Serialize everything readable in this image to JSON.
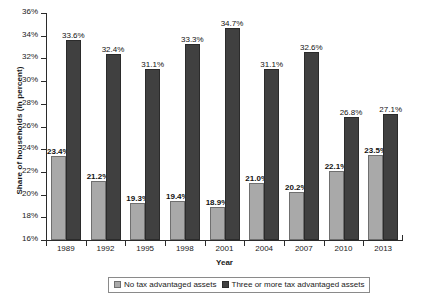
{
  "chart_data": {
    "type": "bar",
    "title": "",
    "subtitle": "",
    "xlabel": "Year",
    "ylabel": "Share of households (in percent)",
    "categories": [
      "1989",
      "1992",
      "1995",
      "1998",
      "2001",
      "2004",
      "2007",
      "2010",
      "2013"
    ],
    "series": [
      {
        "name": "No tax advantaged assets",
        "color": "#a9a9a9",
        "values": [
          23.4,
          21.2,
          19.3,
          19.4,
          18.9,
          21.0,
          20.2,
          22.1,
          23.5
        ],
        "labels": [
          "23.4%",
          "21.2%",
          "19.3%",
          "19.4%",
          "18.9%",
          "21.0%",
          "20.2%",
          "22.1%",
          "23.5%"
        ]
      },
      {
        "name": "Three or more tax advantaged assets",
        "color": "#404040",
        "values": [
          33.6,
          32.4,
          31.1,
          33.3,
          34.7,
          31.1,
          32.6,
          26.8,
          27.1
        ],
        "labels": [
          "33.6%",
          "32.4%",
          "31.1%",
          "33.3%",
          "34.7%",
          "31.1%",
          "32.6%",
          "26.8%",
          "27.1%"
        ]
      }
    ],
    "ylim": [
      16,
      36
    ],
    "ytick_step": 2,
    "ytick_labels": [
      "36%",
      "34%",
      "32%",
      "30%",
      "28%",
      "26%",
      "24%",
      "22%",
      "20%",
      "18%",
      "16%"
    ],
    "ytick_values": [
      36,
      34,
      32,
      30,
      28,
      26,
      24,
      22,
      20,
      18,
      16
    ],
    "grid": false,
    "legend_position": "bottom"
  }
}
